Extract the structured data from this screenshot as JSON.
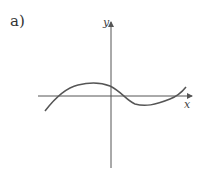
{
  "figure": {
    "part_label": "a)",
    "x_axis_label": "x",
    "y_axis_label": "y",
    "curve_description": "cubic-like curve crossing x-axis twice, local max left of y-axis, local min right of y-axis"
  },
  "colors": {
    "axis": "#555555",
    "curve": "#555555",
    "text": "#333333"
  }
}
